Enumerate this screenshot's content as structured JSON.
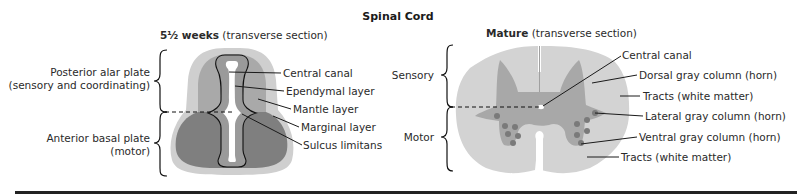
{
  "title": "Spinal Cord",
  "colors": {
    "marginal": "#cfcfcf",
    "mantle_alar": "#a9a9a9",
    "mantle_basal": "#7f7f7f",
    "ependymal": "#9a9a9a",
    "canal": "#ffffff",
    "white_matter": "#d3d3d3",
    "gray_matter": "#a8a8a8",
    "nuclei": "#7a7a7a",
    "bottom_rule": "#222222"
  },
  "embryo": {
    "heading_bold": "5½ weeks",
    "heading_rest": " (transverse section)",
    "side_labels": {
      "upper": [
        "Posterior alar plate",
        "(sensory and coordinating)"
      ],
      "lower": [
        "Anterior basal plate",
        "(motor)"
      ]
    },
    "callouts": [
      "Central canal",
      "Ependymal layer",
      "Mantle layer",
      "Marginal layer",
      "Sulcus limitans"
    ]
  },
  "mature": {
    "heading_bold": "Mature",
    "heading_rest": " (transverse section)",
    "side_labels": {
      "upper": "Sensory",
      "lower": "Motor"
    },
    "callouts": [
      "Central canal",
      "Dorsal gray column (horn)",
      "Tracts (white matter)",
      "Lateral gray column (horn)",
      "Ventral gray column (horn)",
      "Tracts (white matter)"
    ]
  }
}
